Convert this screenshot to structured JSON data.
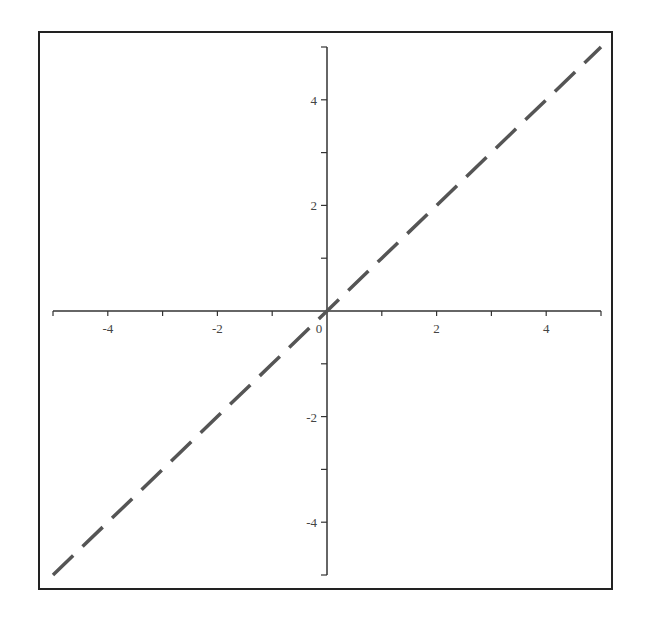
{
  "chart_data": {
    "type": "line",
    "title": "",
    "xlabel": "",
    "ylabel": "",
    "xlim": [
      -5,
      5
    ],
    "ylim": [
      -5,
      5
    ],
    "grid": false,
    "legend": null,
    "axes_style": "crossing-at-origin",
    "x_ticks": {
      "major": [
        -4,
        -2,
        0,
        2,
        4
      ],
      "minor": [
        -5,
        -3,
        -1,
        1,
        3,
        5
      ]
    },
    "y_ticks": {
      "major": [
        -4,
        -2,
        2,
        4
      ],
      "minor": [
        -5,
        -3,
        -1,
        1,
        3,
        5
      ]
    },
    "x_tick_labels": [
      "-4",
      "-2",
      "0",
      "2",
      "4"
    ],
    "y_tick_labels": [
      "4",
      "2",
      "-2",
      "-4"
    ],
    "series": [
      {
        "name": "y = x",
        "style": "dashed",
        "color": "#555555",
        "x": [
          -5,
          -4,
          -3,
          -2,
          -1,
          0,
          1,
          2,
          3,
          4,
          5
        ],
        "y": [
          -5,
          -4,
          -3,
          -2,
          -1,
          0,
          1,
          2,
          3,
          4,
          5
        ]
      }
    ]
  },
  "colors": {
    "axis": "#333333",
    "frame": "#222222",
    "line": "#555555"
  }
}
